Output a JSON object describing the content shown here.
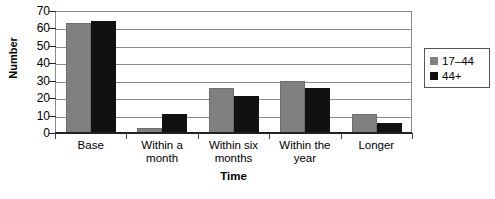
{
  "chart_data": {
    "type": "bar",
    "title": "",
    "xlabel": "Time",
    "ylabel": "Number",
    "categories": [
      "Base",
      "Within a month",
      "Within six months",
      "Within the year",
      "Longer"
    ],
    "category_lines": [
      [
        "Base"
      ],
      [
        "Within a",
        "month"
      ],
      [
        "Within six",
        "months"
      ],
      [
        "Within the",
        "year"
      ],
      [
        "Longer"
      ]
    ],
    "series": [
      {
        "name": "17–44",
        "color": "#808080",
        "values": [
          63,
          3,
          26,
          30,
          11
        ]
      },
      {
        "name": "44+",
        "color": "#111111",
        "values": [
          64,
          11,
          21,
          26,
          6
        ]
      }
    ],
    "ylim": [
      0,
      70
    ],
    "ytick_values": [
      70,
      60,
      50,
      40,
      30,
      20,
      10,
      0
    ],
    "ytick_labels": [
      "70",
      "60",
      "50",
      "40",
      "30",
      "20",
      "10",
      "0"
    ],
    "grid": true,
    "grid_axis": "y",
    "legend_position": "right",
    "legend": [
      "17–44",
      "44+"
    ]
  },
  "axes": {
    "y_title": "Number",
    "x_title": "Time"
  }
}
